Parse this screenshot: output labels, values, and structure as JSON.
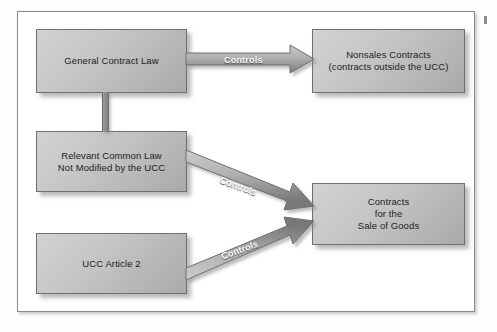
{
  "figure": {
    "border_color": "#8a8a8a",
    "box_fill_light": "#d2d2d2",
    "box_fill_dark": "#a9a9a9",
    "box_border_color": "#6f6f6f",
    "arrow_fill_light": "#bfbfbf",
    "arrow_fill_dark": "#7e7e7e",
    "label_color": "#ffffff",
    "text_color": "#1d1d1d"
  },
  "nodes": {
    "general_contract_law": {
      "line1": "General Contract Law"
    },
    "nonsales_contracts": {
      "line1": "Nonsales Contracts",
      "line2": "(contracts outside the UCC)"
    },
    "relevant_common_law": {
      "line1": "Relevant Common Law",
      "line2": "Not Modified by the UCC"
    },
    "ucc_article_2": {
      "line1": "UCC Article 2"
    },
    "contracts_sale_of_goods": {
      "line1": "Contracts",
      "line2": "for the",
      "line3": "Sale of Goods"
    }
  },
  "arrows": {
    "top": {
      "label": "Controls",
      "from": "General Contract Law",
      "to": "Nonsales Contracts"
    },
    "middle": {
      "label": "Controls",
      "from": "Relevant Common Law Not Modified by the UCC",
      "to": "Contracts for the Sale of Goods"
    },
    "bottom": {
      "label": "Controls",
      "from": "UCC Article 2",
      "to": "Contracts for the Sale of Goods"
    }
  },
  "connector": {
    "name": "vertical-connector",
    "from": "General Contract Law",
    "to": "Relevant Common Law Not Modified by the UCC"
  }
}
